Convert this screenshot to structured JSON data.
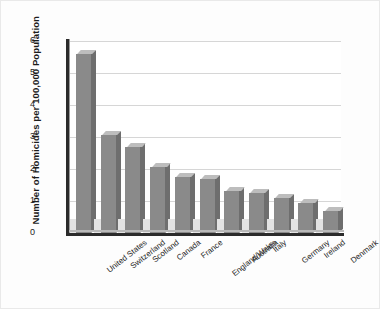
{
  "chart_data": {
    "type": "bar",
    "title": "",
    "xlabel": "",
    "ylabel": "Number of Homicides per 100,000 Population",
    "ylim": [
      0,
      6
    ],
    "yticks": [
      "0",
      "1",
      "2",
      "3",
      "4",
      "5",
      "6"
    ],
    "grid": true,
    "legend": false,
    "bar_color": "#8a8a8a",
    "bar_top_color": "#bdbdbd",
    "bar_side_color": "#6e6e6e",
    "categories": [
      "United States",
      "Switzerland",
      "Scotland",
      "Canada",
      "France",
      "England/Wales",
      "Australia",
      "Italy",
      "Germany",
      "Ireland",
      "Denmark"
    ],
    "values": [
      5.6,
      3.05,
      2.7,
      2.05,
      1.75,
      1.7,
      1.3,
      1.25,
      1.1,
      0.95,
      0.7
    ]
  }
}
